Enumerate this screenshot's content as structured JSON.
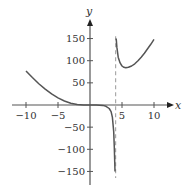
{
  "chart_data": {
    "type": "line",
    "title": "",
    "xlabel": "x",
    "ylabel": "y",
    "xlim": [
      -11,
      12
    ],
    "ylim": [
      -175,
      190
    ],
    "x_ticks": [
      -10,
      -5,
      5,
      10
    ],
    "x_tick_labels": [
      "−10",
      "−5",
      "5",
      "10"
    ],
    "y_ticks": [
      150,
      100,
      50,
      -50,
      -100,
      -150
    ],
    "y_tick_labels": [
      "150",
      "100",
      "50",
      "−50",
      "−100",
      "−150"
    ],
    "grid": false,
    "legend": null,
    "asymptote": {
      "type": "vertical",
      "x": 4,
      "style": "dashed"
    },
    "series": [
      {
        "name": "left branch",
        "x": [
          -10,
          -9,
          -8,
          -7,
          -6,
          -5,
          -4,
          -3,
          -2,
          -1,
          0,
          1,
          2,
          2.5,
          3,
          3.3,
          3.5,
          3.7,
          3.8,
          3.9
        ],
        "y": [
          77,
          62,
          48,
          36,
          25,
          16,
          9,
          4,
          1,
          0,
          0,
          0,
          -1,
          -3,
          -8,
          -15,
          -28,
          -60,
          -95,
          -150
        ]
      },
      {
        "name": "right branch",
        "x": [
          4.1,
          4.2,
          4.4,
          4.7,
          5,
          5.3,
          5.6,
          6,
          6.5,
          7,
          7.5,
          8,
          8.5,
          9,
          9.5,
          10
        ],
        "y": [
          150,
          130,
          108,
          95,
          88,
          85,
          84,
          85,
          88,
          93,
          100,
          108,
          117,
          127,
          137,
          148
        ]
      }
    ]
  }
}
